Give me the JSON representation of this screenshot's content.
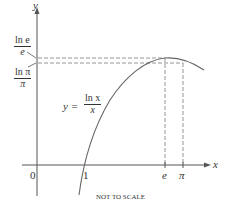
{
  "diagram": {
    "axes": {
      "x_label": "x",
      "y_label": "y",
      "origin_label": "0"
    },
    "x_ticks": [
      "1",
      "e",
      "π"
    ],
    "y_labels": [
      {
        "num": "ln e",
        "den": "e"
      },
      {
        "num": "ln π",
        "den": "π"
      }
    ],
    "curve_label": {
      "lhs": "y =",
      "num": "ln x",
      "den": "x"
    },
    "note": "NOT TO SCALE"
  }
}
